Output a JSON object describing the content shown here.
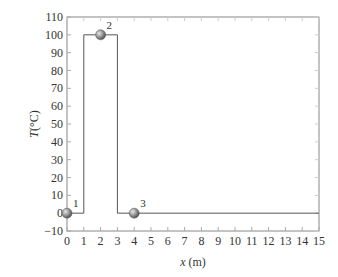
{
  "chart_data": {
    "type": "line",
    "title": "",
    "xlabel": "x (m)",
    "xlabel_var": "x",
    "xlabel_unit": " (m)",
    "ylabel": "T(°C)",
    "ylabel_var": "T",
    "ylabel_unit": "(°C)",
    "xlim": [
      0,
      15
    ],
    "ylim": [
      -10,
      110
    ],
    "xticks": [
      0,
      1,
      2,
      3,
      4,
      5,
      6,
      7,
      8,
      9,
      10,
      11,
      12,
      13,
      14,
      15
    ],
    "yticks": [
      -10,
      0,
      10,
      20,
      30,
      40,
      50,
      60,
      70,
      80,
      90,
      100,
      110
    ],
    "grid": false,
    "series": [
      {
        "name": "temperature profile",
        "x": [
          0,
          1,
          1,
          3,
          3,
          15
        ],
        "y": [
          0,
          0,
          100,
          100,
          0,
          0
        ]
      }
    ],
    "points": [
      {
        "label": "1",
        "x": 0,
        "y": 0
      },
      {
        "label": "2",
        "x": 2,
        "y": 100
      },
      {
        "label": "3",
        "x": 4,
        "y": 0
      }
    ]
  }
}
